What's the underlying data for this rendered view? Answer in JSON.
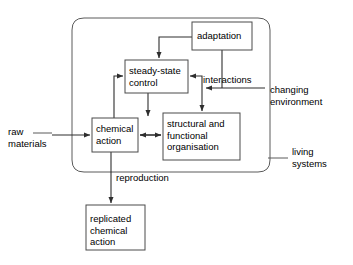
{
  "diagram": {
    "stroke_color": "#3a3a3a",
    "box_fill": "#ffffff",
    "background": "#ffffff",
    "boundary_label": "living systems",
    "boxes": [
      {
        "id": "adaptation",
        "label": "adaptation",
        "x": 192,
        "y": 22,
        "w": 60,
        "h": 28
      },
      {
        "id": "steady-state-control",
        "label": "steady-state\ncontrol",
        "x": 125,
        "y": 60,
        "w": 63,
        "h": 33
      },
      {
        "id": "chemical-action",
        "label": "chemical\naction",
        "x": 92,
        "y": 118,
        "w": 46,
        "h": 34
      },
      {
        "id": "structural-functional-organisation",
        "label": "structural and\nfunctional\norganisation",
        "x": 163,
        "y": 113,
        "w": 77,
        "h": 47
      },
      {
        "id": "replicated-chemical-action",
        "label": "replicated\nchemical\naction",
        "x": 86,
        "y": 205,
        "w": 59,
        "h": 45
      }
    ],
    "labels": [
      {
        "id": "raw-materials",
        "text": "raw\nmaterials",
        "x": 8,
        "y": 126
      },
      {
        "id": "interactions",
        "text": "interactions",
        "x": 203,
        "y": 74
      },
      {
        "id": "changing-environment",
        "text": "changing\nenvironment",
        "x": 270,
        "y": 84
      },
      {
        "id": "living-systems",
        "text": "living\nsystems",
        "x": 292,
        "y": 146
      },
      {
        "id": "reproduction",
        "text": "reproduction",
        "x": 116,
        "y": 172
      }
    ]
  }
}
